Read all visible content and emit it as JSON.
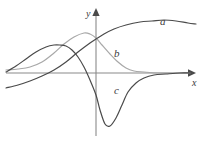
{
  "figure": {
    "background_color": "#ffffff",
    "width": 205,
    "height": 143
  },
  "axes": {
    "origin": {
      "x": 96,
      "y": 73
    },
    "x_axis": {
      "label": "x",
      "color": "#8a8a8a",
      "start_x": 6,
      "end_x": 190,
      "y": 73,
      "arrow": "right"
    },
    "y_axis": {
      "label": "y",
      "color": "#8a8a8a",
      "x": 96,
      "start_y": 136,
      "end_y": 14,
      "arrow": "up"
    }
  },
  "chart_data": {
    "type": "line",
    "title": "",
    "xlabel": "x",
    "ylabel": "y",
    "grid": false,
    "legend_position": "inline-curve-labels",
    "xlim": [
      -96,
      109
    ],
    "ylim": [
      -70,
      73
    ],
    "series": [
      {
        "name": "a",
        "label": "a",
        "color": "#4a4a4a",
        "description": "sigmoid-like rising curve from lower-left through origin region to a broad high plateau on the right that peaks then declines slightly",
        "points_px": [
          [
            6,
            88
          ],
          [
            18,
            85
          ],
          [
            30,
            81
          ],
          [
            42,
            76
          ],
          [
            54,
            70
          ],
          [
            66,
            62
          ],
          [
            78,
            52
          ],
          [
            90,
            43
          ],
          [
            96,
            39
          ],
          [
            104,
            34
          ],
          [
            114,
            29
          ],
          [
            126,
            25
          ],
          [
            140,
            22
          ],
          [
            152,
            21
          ],
          [
            164,
            20
          ],
          [
            176,
            21
          ],
          [
            188,
            23
          ],
          [
            196,
            24
          ]
        ]
      },
      {
        "name": "b",
        "label": "b",
        "color": "#a8a8a8",
        "description": "bell-shaped hump peaking left of the y-axis then falling and flattening onto the x-axis on the right",
        "points_px": [
          [
            6,
            70
          ],
          [
            18,
            69
          ],
          [
            30,
            67
          ],
          [
            42,
            62
          ],
          [
            54,
            53
          ],
          [
            64,
            44
          ],
          [
            74,
            37
          ],
          [
            84,
            33
          ],
          [
            90,
            34
          ],
          [
            96,
            38
          ],
          [
            102,
            45
          ],
          [
            110,
            54
          ],
          [
            118,
            62
          ],
          [
            126,
            68
          ],
          [
            134,
            71
          ],
          [
            144,
            72
          ],
          [
            158,
            73
          ],
          [
            176,
            73
          ],
          [
            190,
            73
          ]
        ]
      },
      {
        "name": "c",
        "label": "c",
        "color": "#4a4a4a",
        "description": "rises to a local maximum left of the y-axis, plunges through the axis to a deep minimum below, then rises back and asymptotes to the x-axis",
        "points_px": [
          [
            6,
            72
          ],
          [
            16,
            66
          ],
          [
            26,
            59
          ],
          [
            36,
            52
          ],
          [
            46,
            47
          ],
          [
            54,
            45
          ],
          [
            60,
            45
          ],
          [
            66,
            46
          ],
          [
            72,
            50
          ],
          [
            78,
            57
          ],
          [
            84,
            67
          ],
          [
            90,
            80
          ],
          [
            96,
            95
          ],
          [
            100,
            110
          ],
          [
            105,
            124
          ],
          [
            110,
            126
          ],
          [
            116,
            118
          ],
          [
            122,
            105
          ],
          [
            128,
            92
          ],
          [
            136,
            83
          ],
          [
            144,
            78
          ],
          [
            154,
            75
          ],
          [
            166,
            74
          ],
          [
            180,
            73
          ],
          [
            190,
            73
          ]
        ]
      }
    ]
  },
  "labels": {
    "a": "a",
    "b": "b",
    "c": "c",
    "x": "x",
    "y": "y"
  }
}
